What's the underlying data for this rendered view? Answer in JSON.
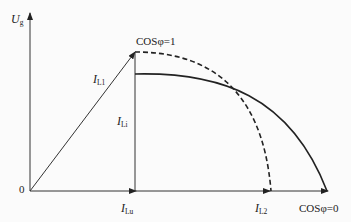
{
  "diagram": {
    "axes": {
      "y_label_main": "U",
      "y_label_sub": "g",
      "origin_label": "0"
    },
    "vectors": {
      "i_l1_main": "I",
      "i_l1_sub": "L1",
      "i_li_main": "I",
      "i_li_sub": "Li",
      "i_lu_main": "I",
      "i_lu_sub": "Lu",
      "i_l2_main": "I",
      "i_l2_sub": "L2"
    },
    "annotations": {
      "cos_phi_1": "COSφ=1",
      "cos_phi_0": "COSφ=0"
    },
    "curves": [
      {
        "name": "dashed-curve",
        "style": "dashed",
        "from": "COSφ=1 point",
        "to": "I_L2"
      },
      {
        "name": "solid-curve",
        "style": "solid",
        "from": "I_Li top",
        "to": "COSφ=0"
      }
    ],
    "colors": {
      "line": "#222222",
      "background": "#fbfbfb"
    }
  }
}
